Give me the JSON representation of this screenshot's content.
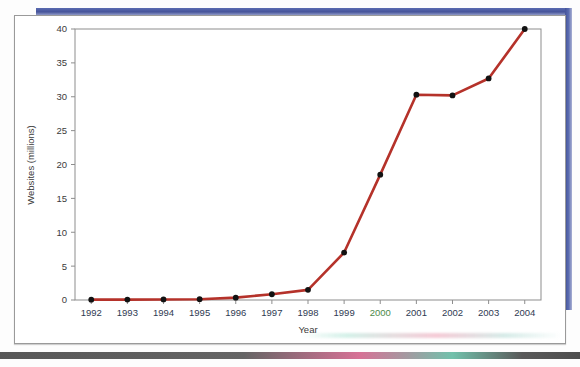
{
  "figure": {
    "background_color": "#ffffff",
    "frame_color": "#9a9a9a",
    "accent_band_color": "#46549b"
  },
  "chart_data": {
    "type": "line",
    "title": "",
    "subtitle": "",
    "xlabel": "Year",
    "ylabel": "Websites (millions)",
    "x": [
      1992,
      1993,
      1994,
      1995,
      1996,
      1997,
      1998,
      1999,
      2000,
      2001,
      2002,
      2003,
      2004
    ],
    "categories": [
      "1992",
      "1993",
      "1994",
      "1995",
      "1996",
      "1997",
      "1998",
      "1999",
      "2000",
      "2001",
      "2002",
      "2003",
      "2004"
    ],
    "values": [
      0.05,
      0.06,
      0.08,
      0.12,
      0.35,
      0.85,
      1.5,
      7.0,
      18.5,
      30.3,
      30.2,
      32.7,
      40.0
    ],
    "series": [
      {
        "name": "Websites (millions)",
        "values": [
          0.05,
          0.06,
          0.08,
          0.12,
          0.35,
          0.85,
          1.5,
          7.0,
          18.5,
          30.3,
          30.2,
          32.7,
          40.0
        ],
        "line_color": "#b5322a",
        "marker_color": "#121212",
        "marker": "circle"
      }
    ],
    "xlim": [
      1991.55,
      2004.45
    ],
    "ylim": [
      0,
      40
    ],
    "ytick_labels": [
      "0",
      "5",
      "10",
      "15",
      "20",
      "25",
      "30",
      "35",
      "40"
    ],
    "ytick_values": [
      0,
      5,
      10,
      15,
      20,
      25,
      30,
      35,
      40
    ],
    "xtick_labels": [
      "1992",
      "1993",
      "1994",
      "1995",
      "1996",
      "1997",
      "1998",
      "1999",
      "2000",
      "2001",
      "2002",
      "2003",
      "2004"
    ],
    "grid": false,
    "legend": null,
    "legend_position": "none",
    "annotations": [],
    "tinted_xtick_label": "2000"
  }
}
